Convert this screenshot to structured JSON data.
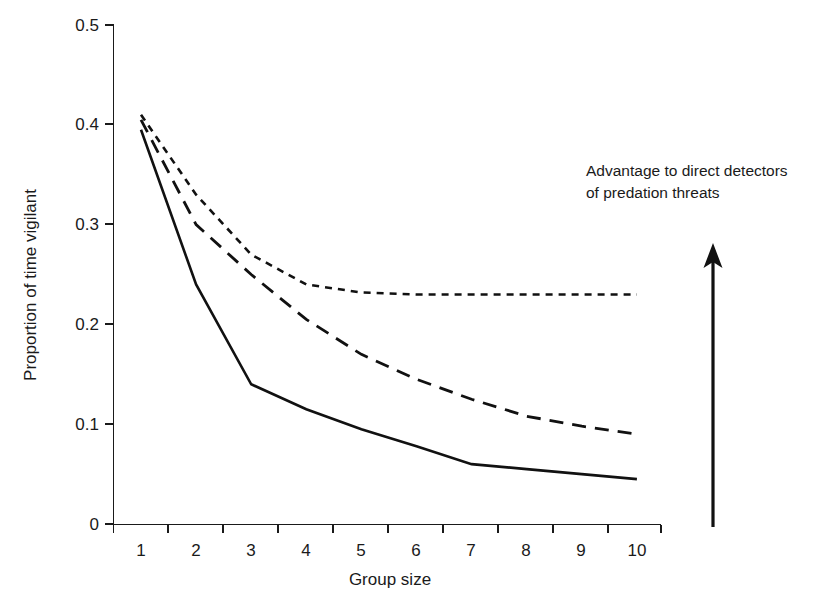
{
  "chart_data": {
    "type": "line",
    "title": "",
    "xlabel": "Group size",
    "ylabel": "Proportion of time vigilant",
    "x": [
      1,
      2,
      3,
      4,
      5,
      6,
      7,
      8,
      9,
      10
    ],
    "xticklabels": [
      "1",
      "2",
      "3",
      "4",
      "5",
      "6",
      "7",
      "8",
      "9",
      "10"
    ],
    "yticklabels": [
      "0",
      "0.1",
      "0.2",
      "0.3",
      "0.4",
      "0.5"
    ],
    "yticks": [
      0,
      0.1,
      0.2,
      0.3,
      0.4,
      0.5
    ],
    "xlim": [
      0.6,
      10.6
    ],
    "ylim": [
      0,
      0.5
    ],
    "grid": false,
    "legend": null,
    "series": [
      {
        "name": "solid-line",
        "style": "solid",
        "values": [
          0.395,
          0.24,
          0.14,
          0.115,
          0.095,
          0.078,
          0.06,
          0.055,
          0.05,
          0.045
        ]
      },
      {
        "name": "dashed-line",
        "style": "dashed",
        "values": [
          0.405,
          0.3,
          0.25,
          0.205,
          0.17,
          0.145,
          0.125,
          0.108,
          0.098,
          0.09
        ]
      },
      {
        "name": "dotted-line",
        "style": "dotted",
        "values": [
          0.41,
          0.33,
          0.27,
          0.24,
          0.232,
          0.23,
          0.23,
          0.23,
          0.23,
          0.23
        ]
      }
    ],
    "annotations": [
      {
        "name": "advantage-note",
        "line1": "Advantage to direct detectors",
        "line2": "of predation threats"
      }
    ],
    "arrow": {
      "name": "upward-arrow",
      "direction": "up"
    },
    "colors": {
      "line": "#111111",
      "axis": "#1a1a1a",
      "background": "#ffffff"
    }
  }
}
